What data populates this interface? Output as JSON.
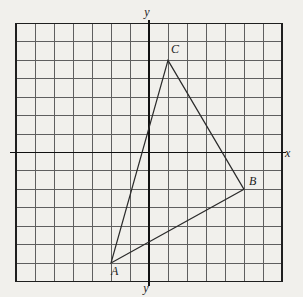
{
  "figure": {
    "axis_labels": {
      "y_top": "y",
      "y_bottom": "y",
      "x_right": "x"
    },
    "grid": {
      "columns": 14,
      "rows": 14,
      "cells_left_of_y_axis": 7,
      "cells_right_of_y_axis": 7,
      "cells_above_x_axis": 7,
      "cells_below_x_axis": 7
    },
    "triangle": {
      "vertices": [
        {
          "label": "A",
          "grid_x": -2,
          "grid_y": -6
        },
        {
          "label": "B",
          "grid_x": 5,
          "grid_y": -2
        },
        {
          "label": "C",
          "grid_x": 1,
          "grid_y": 5
        }
      ]
    },
    "colors": {
      "paper": "#f1f0ec",
      "grid_line": "#5f5f5f",
      "grid_border": "#1f1f1f",
      "axis": "#111111",
      "triangle": "#2b2b2b",
      "label": "#1c1c1c"
    }
  }
}
